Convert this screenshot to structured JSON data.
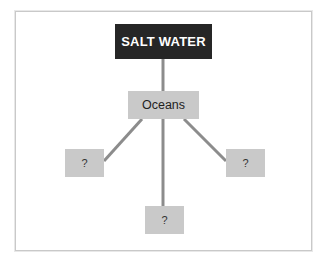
{
  "diagram": {
    "type": "concept-map",
    "root": {
      "label": "SALT WATER",
      "color": "#262626",
      "text_color": "#ffffff"
    },
    "child": {
      "label": "Oceans",
      "color": "#c9c9c9"
    },
    "leaves": [
      {
        "position": "left",
        "label": "?"
      },
      {
        "position": "bottom",
        "label": "?"
      },
      {
        "position": "right",
        "label": "?"
      }
    ],
    "connector_color": "#8c8c8c",
    "edges": [
      {
        "from": "SALT WATER",
        "to": "Oceans"
      },
      {
        "from": "Oceans",
        "to": "leaf-left"
      },
      {
        "from": "Oceans",
        "to": "leaf-bottom"
      },
      {
        "from": "Oceans",
        "to": "leaf-right"
      }
    ]
  }
}
